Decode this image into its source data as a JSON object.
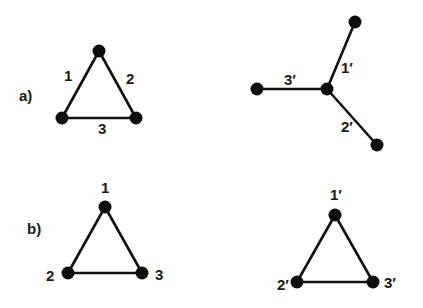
{
  "panels": {
    "a": {
      "label": "a)",
      "left_graph": {
        "type": "triangle",
        "edge_labels": [
          "1",
          "2",
          "3"
        ]
      },
      "right_graph": {
        "type": "star",
        "edge_labels": [
          "1′",
          "2′",
          "3′"
        ]
      }
    },
    "b": {
      "label": "b)",
      "left_graph": {
        "type": "triangle",
        "node_labels": [
          "1",
          "2",
          "3"
        ]
      },
      "right_graph": {
        "type": "triangle",
        "node_labels": [
          "1′",
          "2′",
          "3′"
        ]
      }
    }
  },
  "colors": {
    "edge": "#111111",
    "node": "#0d0d0d",
    "text": "#1a1a1a",
    "background": "#ffffff"
  }
}
